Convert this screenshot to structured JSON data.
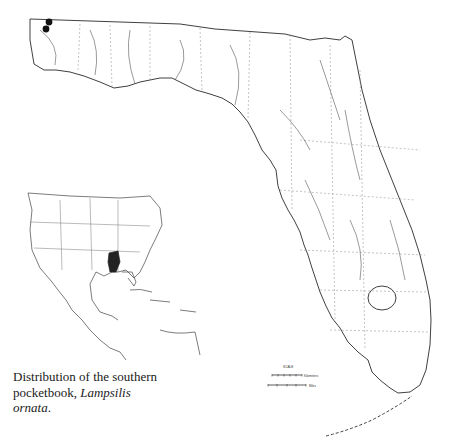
{
  "map": {
    "subject": "Distribution of the southern pocketbook",
    "region": "Florida",
    "records": [
      {
        "x": 49,
        "y": 22
      },
      {
        "x": 46,
        "y": 29
      }
    ],
    "inset": {
      "region": "North America",
      "highlighted_range": "Mobile Bay basin (Alabama)"
    },
    "scale": {
      "title": "SCALE",
      "units": [
        "Kilometers",
        "Miles"
      ]
    },
    "colors": {
      "line": "#222222",
      "record_dot": "#111111",
      "range_fill": "#222222"
    }
  },
  "caption": {
    "line1": "Distribution of the southern",
    "line2_plain": "pocketbook, ",
    "line2_italic": "Lampsilis",
    "line3_italic": "ornata",
    "line3_end": "."
  }
}
